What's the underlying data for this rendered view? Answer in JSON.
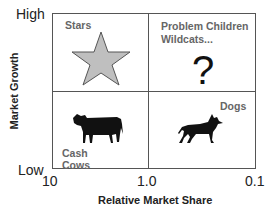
{
  "diagram": {
    "y_axis": {
      "title": "Market Growth",
      "high_label": "High",
      "low_label": "Low"
    },
    "x_axis": {
      "title": "Relative Market Share",
      "ticks": [
        "10",
        "1.0",
        "0.1"
      ]
    },
    "quadrants": [
      {
        "id": "top-left",
        "label": "Stars",
        "icon": "star-icon",
        "icon_color": "#bfbfbf"
      },
      {
        "id": "top-right",
        "label_line1": "Problem Children",
        "label_line2": "Wildcats...",
        "icon": "question-mark-icon",
        "symbol": "?"
      },
      {
        "id": "bottom-left",
        "label_line1": "Cash",
        "label_line2": "Cows",
        "icon": "cow-icon"
      },
      {
        "id": "bottom-right",
        "label": "Dogs",
        "icon": "dog-icon"
      }
    ],
    "colors": {
      "frame": "#555555",
      "label": "#666666",
      "silhouette": "#111111"
    }
  }
}
